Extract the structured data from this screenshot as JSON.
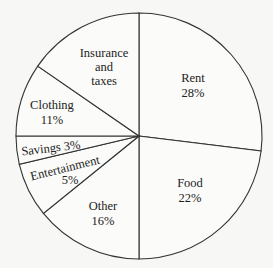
{
  "chart_data": {
    "type": "pie",
    "title": "",
    "start_angle": "12 o'clock",
    "direction": "clockwise",
    "slices": [
      {
        "label": "Rent",
        "value": 28,
        "display": "28%",
        "end_deg": 97
      },
      {
        "label": "Food",
        "value": 22,
        "display": "22%",
        "end_deg": 180
      },
      {
        "label": "Other",
        "value": 16,
        "display": "16%",
        "end_deg": 231
      },
      {
        "label": "Entertainment",
        "value": 5,
        "display": "5%",
        "end_deg": 256.7
      },
      {
        "label": "Savings",
        "value": 3,
        "display": "3%",
        "end_deg": 270
      },
      {
        "label": "Clothing",
        "value": 11,
        "display": "11%",
        "end_deg": 304.6
      },
      {
        "label": "Insurance and taxes",
        "value": 15,
        "display": "",
        "end_deg": 360
      }
    ],
    "legend": "none",
    "colors": {
      "fill": "#fbfbf9",
      "stroke": "#333333",
      "text": "#222222"
    }
  },
  "labels": {
    "rent": {
      "name": "Rent",
      "pct": "28%"
    },
    "food": {
      "name": "Food",
      "pct": "22%"
    },
    "other": {
      "name": "Other",
      "pct": "16%"
    },
    "entertainment": {
      "name": "Entertainment",
      "pct": "5%"
    },
    "savings": {
      "name": "Savings 3%"
    },
    "clothing": {
      "name": "Clothing",
      "pct": "11%"
    },
    "insurance": {
      "line1": "Insurance",
      "line2": "and",
      "line3": "taxes"
    }
  }
}
